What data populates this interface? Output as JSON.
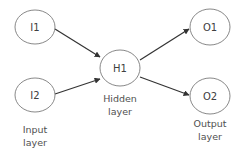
{
  "diagram": {
    "type": "neural-network",
    "nodes": [
      {
        "id": "I1",
        "label": "I1",
        "layer": "input"
      },
      {
        "id": "I2",
        "label": "I2",
        "layer": "input"
      },
      {
        "id": "H1",
        "label": "H1",
        "layer": "hidden"
      },
      {
        "id": "O1",
        "label": "O1",
        "layer": "output"
      },
      {
        "id": "O2",
        "label": "O2",
        "layer": "output"
      }
    ],
    "edges": [
      {
        "from": "I1",
        "to": "H1"
      },
      {
        "from": "I2",
        "to": "H1"
      },
      {
        "from": "H1",
        "to": "O1"
      },
      {
        "from": "H1",
        "to": "O2"
      }
    ],
    "layers": {
      "input": {
        "line1": "Input",
        "line2": "layer"
      },
      "hidden": {
        "line1": "Hidden",
        "line2": "layer"
      },
      "output": {
        "line1": "Output",
        "line2": "layer"
      }
    }
  }
}
